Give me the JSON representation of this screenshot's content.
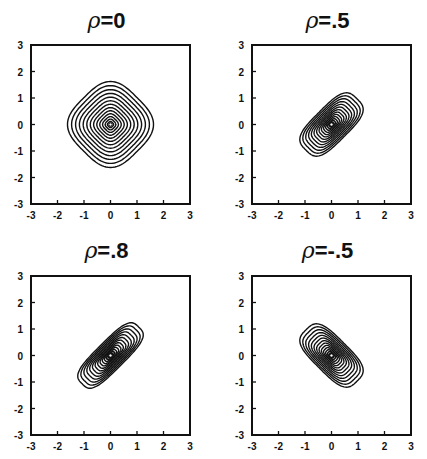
{
  "chart_data": [
    {
      "type": "contour",
      "title": "ρ=0",
      "title_symbol": "ρ",
      "title_value": "=0",
      "rho": 0,
      "xlim": [
        -3,
        3
      ],
      "ylim": [
        -3,
        3
      ],
      "xticks": [
        "-3",
        "-2",
        "-1",
        "0",
        "1",
        "2",
        "3"
      ],
      "yticks": [
        "-3",
        "-2",
        "-1",
        "0",
        "1",
        "2",
        "3"
      ],
      "xlabel": "",
      "ylabel": "",
      "grid": false,
      "contour_orientation": "diamond (symmetric)",
      "outer_contour_extent": 1.4,
      "n_contours": 14
    },
    {
      "type": "contour",
      "title": "ρ=.5",
      "title_symbol": "ρ",
      "title_value": "=.5",
      "rho": 0.5,
      "xlim": [
        -3,
        3
      ],
      "ylim": [
        -3,
        3
      ],
      "xticks": [
        "-3",
        "-2",
        "-1",
        "0",
        "1",
        "2",
        "3"
      ],
      "yticks": [
        "-3",
        "-2",
        "-1",
        "0",
        "1",
        "2",
        "3"
      ],
      "xlabel": "",
      "ylabel": "",
      "grid": false,
      "contour_orientation": "elongated along y=x",
      "outer_contour_extent": 1.4,
      "n_contours": 14
    },
    {
      "type": "contour",
      "title": "ρ=.8",
      "title_symbol": "ρ",
      "title_value": "=.8",
      "rho": 0.8,
      "xlim": [
        -3,
        3
      ],
      "ylim": [
        -3,
        3
      ],
      "xticks": [
        "-3",
        "-2",
        "-1",
        "0",
        "1",
        "2",
        "3"
      ],
      "yticks": [
        "-3",
        "-2",
        "-1",
        "0",
        "1",
        "2",
        "3"
      ],
      "xlabel": "",
      "ylabel": "",
      "grid": false,
      "contour_orientation": "strongly elongated along y=x",
      "outer_contour_extent": 1.4,
      "n_contours": 14
    },
    {
      "type": "contour",
      "title": "ρ=-.5",
      "title_symbol": "ρ",
      "title_value": "=-.5",
      "rho": -0.5,
      "xlim": [
        -3,
        3
      ],
      "ylim": [
        -3,
        3
      ],
      "xticks": [
        "-3",
        "-2",
        "-1",
        "0",
        "1",
        "2",
        "3"
      ],
      "yticks": [
        "-3",
        "-2",
        "-1",
        "0",
        "1",
        "2",
        "3"
      ],
      "xlabel": "",
      "ylabel": "",
      "grid": false,
      "contour_orientation": "elongated along y=-x",
      "outer_contour_extent": 1.4,
      "n_contours": 14
    }
  ],
  "panels": [
    {
      "title_symbol": "ρ",
      "title_value": "=0"
    },
    {
      "title_symbol": "ρ",
      "title_value": "=.5"
    },
    {
      "title_symbol": "ρ",
      "title_value": "=.8"
    },
    {
      "title_symbol": "ρ",
      "title_value": "=-.5"
    }
  ],
  "colors": {
    "line": "#111111",
    "background": "#ffffff"
  }
}
